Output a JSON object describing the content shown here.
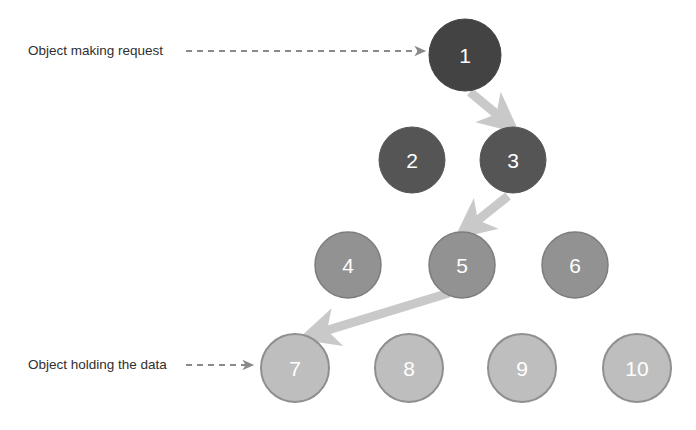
{
  "diagram": {
    "background_color": "#ffffff",
    "annotations": [
      {
        "id": "annotation-making-request",
        "text": "Object making request",
        "text_x": 28,
        "text_y": 51,
        "arrow_x1": 186,
        "arrow_y1": 51,
        "arrow_x2": 427,
        "arrow_y2": 51,
        "style": "dashed",
        "color": "#808080"
      },
      {
        "id": "annotation-holding-data",
        "text": "Object holding the data",
        "text_x": 28,
        "text_y": 365,
        "arrow_x1": 186,
        "arrow_y1": 365,
        "arrow_x2": 255,
        "arrow_y2": 365,
        "style": "dashed",
        "color": "#808080"
      }
    ],
    "nodes": [
      {
        "id": "node-1",
        "label": "1",
        "cx": 465,
        "cy": 55,
        "r": 36,
        "fill": "#434343",
        "stroke": "#434343",
        "tier": "root"
      },
      {
        "id": "node-2",
        "label": "2",
        "cx": 412,
        "cy": 160,
        "r": 33,
        "fill": "#555555",
        "stroke": "#555555",
        "tier": "mid-upper"
      },
      {
        "id": "node-3",
        "label": "3",
        "cx": 513,
        "cy": 160,
        "r": 33,
        "fill": "#555555",
        "stroke": "#555555",
        "tier": "mid-upper"
      },
      {
        "id": "node-4",
        "label": "4",
        "cx": 348,
        "cy": 265,
        "r": 33,
        "fill": "#929292",
        "stroke": "#7d7d7d",
        "tier": "mid-lower"
      },
      {
        "id": "node-5",
        "label": "5",
        "cx": 462,
        "cy": 265,
        "r": 33,
        "fill": "#929292",
        "stroke": "#7d7d7d",
        "tier": "mid-lower"
      },
      {
        "id": "node-6",
        "label": "6",
        "cx": 575,
        "cy": 265,
        "r": 33,
        "fill": "#929292",
        "stroke": "#7d7d7d",
        "tier": "mid-lower"
      },
      {
        "id": "node-7",
        "label": "7",
        "cx": 295,
        "cy": 368,
        "r": 34,
        "fill": "#bebebe",
        "stroke": "#8f8f8f",
        "tier": "leaf"
      },
      {
        "id": "node-8",
        "label": "8",
        "cx": 409,
        "cy": 368,
        "r": 34,
        "fill": "#bebebe",
        "stroke": "#8f8f8f",
        "tier": "leaf"
      },
      {
        "id": "node-9",
        "label": "9",
        "cx": 522,
        "cy": 368,
        "r": 34,
        "fill": "#bebebe",
        "stroke": "#8f8f8f",
        "tier": "leaf"
      },
      {
        "id": "node-10",
        "label": "10",
        "cx": 637,
        "cy": 368,
        "r": 34,
        "fill": "#bebebe",
        "stroke": "#8f8f8f",
        "tier": "leaf"
      }
    ],
    "edges": [
      {
        "id": "edge-1-to-3",
        "from": "1",
        "to": "3",
        "x1": 470,
        "y1": 92,
        "x2": 508,
        "y2": 124,
        "color": "#c9c9c9",
        "width": 9
      },
      {
        "id": "edge-3-to-5",
        "from": "3",
        "to": "5",
        "x1": 507,
        "y1": 196,
        "x2": 466,
        "y2": 229,
        "color": "#c9c9c9",
        "width": 9
      },
      {
        "id": "edge-5-to-7",
        "from": "5",
        "to": "7",
        "x1": 448,
        "y1": 294,
        "x2": 312,
        "y2": 336,
        "color": "#c9c9c9",
        "width": 9
      }
    ],
    "node_label_color": "#ffffff",
    "edge_color": "#c9c9c9",
    "annotation_text_color": "#2f2f2f"
  }
}
